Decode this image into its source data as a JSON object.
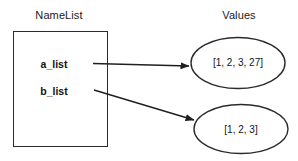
{
  "diagram": {
    "title_left": "NameList",
    "title_right": "Values",
    "variables": [
      {
        "name": "a_list"
      },
      {
        "name": "b_list"
      }
    ],
    "values": [
      {
        "text": "[1, 2, 3, 27]"
      },
      {
        "text": "[1, 2, 3]"
      }
    ],
    "colors": {
      "stroke": "#2b2b2b",
      "text": "#141414",
      "background": "#ffffff"
    }
  }
}
